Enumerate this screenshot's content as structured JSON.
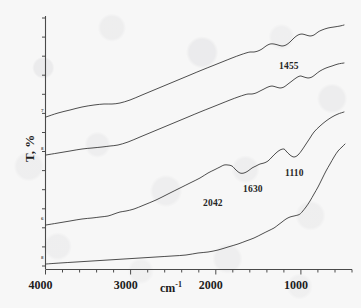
{
  "figure": {
    "kind": "ftir-transmittance-spectra",
    "background_color": "#f7f7f7",
    "trace_color": "#3a3a3a",
    "axis_color": "#4a4a4a",
    "label_color": "#1d1d1d"
  },
  "axes": {
    "x_title_text": "cm",
    "x_title_sup": "-1",
    "y_title": "T, %",
    "x_ticks": [
      "4000",
      "3000",
      "2000",
      "1000"
    ],
    "x_tick_values": [
      4000,
      3000,
      2000,
      1000
    ],
    "x_min": 4000,
    "x_max": 400,
    "x_minor_tick_step": 200,
    "y_ticks_labeled": false,
    "y_minor_tick_count": 13
  },
  "curve_ids": [
    "7",
    "8",
    "6",
    "8"
  ],
  "peak_labels": [
    {
      "text": "1455",
      "x": 279,
      "y": 61
    },
    {
      "text": "2042",
      "x": 203,
      "y": 198
    },
    {
      "text": "1630",
      "x": 243,
      "y": 184
    },
    {
      "text": "1110",
      "x": 285,
      "y": 168
    }
  ],
  "chart_data": {
    "type": "line",
    "title": "",
    "xlabel": "cm-1",
    "ylabel": "T, %",
    "xlim": [
      4000,
      400
    ],
    "ylim": [
      0,
      100
    ],
    "grid": false,
    "legend": "none",
    "x_tick_labels": [
      "4000",
      "3000",
      "2000",
      "1000"
    ],
    "annotations": [
      "1455",
      "2042",
      "1630",
      "1110"
    ],
    "note": "Four vertically offset FTIR transmittance traces; y values are arbitrary offset transmittance units in pixel-space of the source plot (y grows downward in screen coords).",
    "series": [
      {
        "name": "curve-a",
        "id_label": "7",
        "points_xy": [
          [
            46,
            117
          ],
          [
            58,
            113
          ],
          [
            70,
            110
          ],
          [
            82,
            107
          ],
          [
            94,
            105
          ],
          [
            104,
            104
          ],
          [
            112,
            104
          ],
          [
            120,
            103
          ],
          [
            130,
            100
          ],
          [
            142,
            95
          ],
          [
            154,
            90
          ],
          [
            166,
            85
          ],
          [
            178,
            80
          ],
          [
            190,
            75
          ],
          [
            202,
            70
          ],
          [
            212,
            66
          ],
          [
            222,
            62
          ],
          [
            232,
            58
          ],
          [
            240,
            55
          ],
          [
            246,
            53
          ],
          [
            250,
            52
          ],
          [
            254,
            52
          ],
          [
            258,
            51
          ],
          [
            262,
            49
          ],
          [
            266,
            46
          ],
          [
            270,
            44
          ],
          [
            274,
            44
          ],
          [
            278,
            45
          ],
          [
            282,
            46
          ],
          [
            286,
            45
          ],
          [
            290,
            42
          ],
          [
            294,
            38
          ],
          [
            298,
            35
          ],
          [
            302,
            34
          ],
          [
            306,
            35
          ],
          [
            310,
            36
          ],
          [
            314,
            35
          ],
          [
            318,
            32
          ],
          [
            322,
            30
          ],
          [
            328,
            28
          ],
          [
            334,
            27
          ],
          [
            340,
            26
          ],
          [
            344,
            25
          ]
        ]
      },
      {
        "name": "curve-b",
        "id_label": "8",
        "points_xy": [
          [
            46,
            155
          ],
          [
            58,
            153
          ],
          [
            70,
            151
          ],
          [
            82,
            149
          ],
          [
            92,
            148
          ],
          [
            102,
            147
          ],
          [
            110,
            146
          ],
          [
            118,
            145
          ],
          [
            128,
            142
          ],
          [
            140,
            137
          ],
          [
            152,
            132
          ],
          [
            164,
            127
          ],
          [
            176,
            122
          ],
          [
            188,
            117
          ],
          [
            200,
            112
          ],
          [
            210,
            108
          ],
          [
            220,
            104
          ],
          [
            230,
            100
          ],
          [
            238,
            97
          ],
          [
            244,
            95
          ],
          [
            248,
            94
          ],
          [
            252,
            94
          ],
          [
            256,
            93
          ],
          [
            260,
            91
          ],
          [
            264,
            89
          ],
          [
            268,
            87
          ],
          [
            272,
            86
          ],
          [
            276,
            87
          ],
          [
            280,
            88
          ],
          [
            284,
            87
          ],
          [
            288,
            84
          ],
          [
            292,
            81
          ],
          [
            296,
            78
          ],
          [
            300,
            76
          ],
          [
            304,
            77
          ],
          [
            308,
            78
          ],
          [
            312,
            77
          ],
          [
            316,
            74
          ],
          [
            320,
            71
          ],
          [
            326,
            68
          ],
          [
            332,
            66
          ],
          [
            338,
            64
          ],
          [
            344,
            63
          ]
        ]
      },
      {
        "name": "curve-c",
        "id_label": "6",
        "points_xy": [
          [
            46,
            225
          ],
          [
            58,
            223
          ],
          [
            70,
            221
          ],
          [
            82,
            219
          ],
          [
            92,
            218
          ],
          [
            100,
            217
          ],
          [
            108,
            216
          ],
          [
            114,
            214
          ],
          [
            120,
            212
          ],
          [
            126,
            211
          ],
          [
            134,
            209
          ],
          [
            144,
            205
          ],
          [
            156,
            200
          ],
          [
            168,
            194
          ],
          [
            180,
            188
          ],
          [
            190,
            183
          ],
          [
            200,
            178
          ],
          [
            208,
            173
          ],
          [
            214,
            170
          ],
          [
            220,
            167
          ],
          [
            224,
            165
          ],
          [
            228,
            165
          ],
          [
            232,
            166
          ],
          [
            236,
            170
          ],
          [
            240,
            173
          ],
          [
            244,
            173
          ],
          [
            248,
            171
          ],
          [
            252,
            168
          ],
          [
            256,
            166
          ],
          [
            260,
            164
          ],
          [
            264,
            163
          ],
          [
            268,
            161
          ],
          [
            272,
            157
          ],
          [
            276,
            153
          ],
          [
            280,
            150
          ],
          [
            284,
            149
          ],
          [
            286,
            151
          ],
          [
            290,
            155
          ],
          [
            294,
            157
          ],
          [
            298,
            155
          ],
          [
            302,
            150
          ],
          [
            306,
            144
          ],
          [
            310,
            138
          ],
          [
            314,
            132
          ],
          [
            320,
            126
          ],
          [
            326,
            121
          ],
          [
            332,
            117
          ],
          [
            338,
            114
          ],
          [
            344,
            112
          ]
        ]
      },
      {
        "name": "curve-d",
        "id_label": "8",
        "points_xy": [
          [
            46,
            264
          ],
          [
            60,
            263
          ],
          [
            76,
            262
          ],
          [
            92,
            261
          ],
          [
            108,
            260
          ],
          [
            124,
            259
          ],
          [
            140,
            258
          ],
          [
            156,
            257
          ],
          [
            172,
            256
          ],
          [
            186,
            255
          ],
          [
            198,
            253
          ],
          [
            208,
            252
          ],
          [
            218,
            250
          ],
          [
            228,
            247
          ],
          [
            238,
            244
          ],
          [
            246,
            241
          ],
          [
            254,
            238
          ],
          [
            262,
            234
          ],
          [
            268,
            231
          ],
          [
            274,
            228
          ],
          [
            278,
            225
          ],
          [
            282,
            222
          ],
          [
            286,
            219
          ],
          [
            290,
            217
          ],
          [
            294,
            216
          ],
          [
            298,
            215
          ],
          [
            300,
            214
          ],
          [
            302,
            212
          ],
          [
            306,
            207
          ],
          [
            310,
            201
          ],
          [
            314,
            194
          ],
          [
            318,
            187
          ],
          [
            322,
            179
          ],
          [
            326,
            171
          ],
          [
            330,
            164
          ],
          [
            334,
            157
          ],
          [
            338,
            151
          ],
          [
            342,
            147
          ],
          [
            345,
            144
          ]
        ]
      }
    ]
  }
}
